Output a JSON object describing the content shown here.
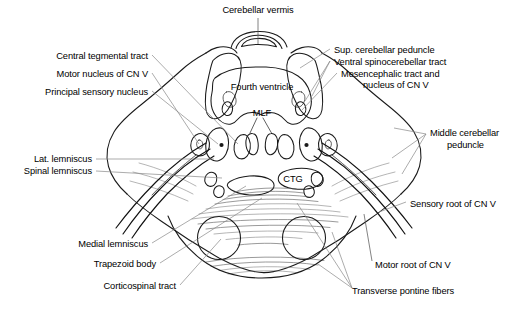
{
  "figure": {
    "type": "anatomical-cross-section",
    "background_color": "#ffffff",
    "line_color": "#1a1a1a",
    "leader_color": "#888888",
    "width": 524,
    "height": 311
  },
  "interior_labels": [
    {
      "id": "fourth-ventricle",
      "text": "Fourth ventricle",
      "x": 262,
      "y": 87
    },
    {
      "id": "mlf",
      "text": "MLF",
      "x": 262,
      "y": 113
    },
    {
      "id": "ctg",
      "text": "CTG",
      "x": 292,
      "y": 180
    }
  ],
  "callouts": {
    "top": [
      {
        "id": "cerebellar-vermis",
        "text": "Cerebellar vermis",
        "align": "center",
        "x": 258,
        "y": 10
      }
    ],
    "left": [
      {
        "id": "central-tegmental-tract",
        "text": "Central tegmental tract",
        "align": "right",
        "x": 148,
        "y": 56
      },
      {
        "id": "motor-nucleus-cn-v",
        "text": "Motor nucleus of CN V",
        "align": "right",
        "x": 148,
        "y": 74
      },
      {
        "id": "principal-sensory-nucleus",
        "text": "Principal sensory nucleus",
        "align": "right",
        "x": 148,
        "y": 92
      },
      {
        "id": "lat-lemniscus",
        "text": "Lat. lemniscus",
        "align": "right",
        "x": 92,
        "y": 160
      },
      {
        "id": "spinal-lemniscus",
        "text": "Spinal lemniscus",
        "align": "right",
        "x": 92,
        "y": 172
      }
    ],
    "bottom_left": [
      {
        "id": "medial-lemniscus",
        "text": "Medial lemniscus",
        "align": "right",
        "x": 148,
        "y": 245
      },
      {
        "id": "trapezoid-body",
        "text": "Trapezoid body",
        "align": "right",
        "x": 156,
        "y": 265
      },
      {
        "id": "corticospinal-tract",
        "text": "Corticospinal tract",
        "align": "right",
        "x": 176,
        "y": 287
      }
    ],
    "right": [
      {
        "id": "sup-cerebellar-peduncle",
        "text": "Sup. cerebellar peduncle",
        "align": "left",
        "x": 334,
        "y": 50
      },
      {
        "id": "ventral-spinocerebellar-tract",
        "text": "Ventral spinocerebellar tract",
        "align": "left",
        "x": 334,
        "y": 62
      },
      {
        "id": "mesencephalic-tract-line1",
        "text": "Mesencephalic tract and",
        "align": "left",
        "x": 341,
        "y": 74
      },
      {
        "id": "mesencephalic-tract-line2",
        "text": "nucleus of CN V",
        "align": "left",
        "x": 363,
        "y": 85
      },
      {
        "id": "middle-cerebellar-peduncle-l1",
        "text": "Middle cerebellar",
        "align": "left",
        "x": 430,
        "y": 133
      },
      {
        "id": "middle-cerebellar-peduncle-l2",
        "text": "peduncle",
        "align": "left",
        "x": 447,
        "y": 145
      },
      {
        "id": "sensory-root-cn-v",
        "text": "Sensory root of CN V",
        "align": "left",
        "x": 410,
        "y": 204
      },
      {
        "id": "motor-root-cn-v",
        "text": "Motor root of CN V",
        "align": "left",
        "x": 375,
        "y": 265
      }
    ],
    "bottom_right": [
      {
        "id": "transverse-pontine-fibers",
        "text": "Transverse pontine fibers",
        "align": "left",
        "x": 352,
        "y": 291
      }
    ]
  }
}
